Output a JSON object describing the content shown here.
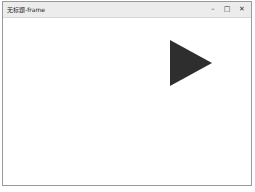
{
  "window": {
    "title": "无标题-frame",
    "controls": {
      "minimize": "–",
      "maximize": "□",
      "close": "✕"
    }
  },
  "canvas": {
    "shape": "play-triangle",
    "shape_color": "#2e2e2e",
    "background": "#ffffff"
  }
}
